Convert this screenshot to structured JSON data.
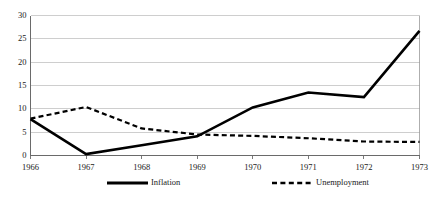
{
  "chart_data": {
    "type": "line",
    "title": "",
    "subtitle": "",
    "xlabel": "",
    "ylabel": "",
    "categories": [
      "1966",
      "1967",
      "1968",
      "1969",
      "1970",
      "1971",
      "1972",
      "1973"
    ],
    "x": [
      1966,
      1967,
      1968,
      1969,
      1970,
      1971,
      1972,
      1973
    ],
    "series": [
      {
        "name": "Inflation",
        "style": "solid",
        "color": "#000000",
        "values": [
          7.8,
          0.3,
          2.2,
          4.1,
          10.3,
          13.5,
          12.5,
          26.7
        ]
      },
      {
        "name": "Unemployment",
        "style": "dashed",
        "color": "#000000",
        "values": [
          7.9,
          10.4,
          5.8,
          4.5,
          4.2,
          3.7,
          3.0,
          2.9
        ]
      }
    ],
    "ylim": [
      0,
      30
    ],
    "xlim": [
      1966,
      1973
    ],
    "yticks": [
      0,
      5,
      10,
      15,
      20,
      25,
      30
    ],
    "ytick_labels": [
      "0",
      "5",
      "10",
      "15",
      "20",
      "25",
      "30"
    ],
    "xtick_labels": [
      "1966",
      "1967",
      "1968",
      "1969",
      "1970",
      "1971",
      "1972",
      "1973"
    ],
    "grid": true,
    "grid_axis": "y",
    "grid_color": "#b9b9b9",
    "legend_position": "bottom",
    "legend_entries": [
      "Inflation",
      "Unemployment"
    ],
    "background_color": "#ffffff"
  },
  "axes": {
    "y_ticks": [
      {
        "label": "30",
        "value": 30
      },
      {
        "label": "25",
        "value": 25
      },
      {
        "label": "20",
        "value": 20
      },
      {
        "label": "15",
        "value": 15
      },
      {
        "label": "10",
        "value": 10
      },
      {
        "label": "5",
        "value": 5
      },
      {
        "label": "0",
        "value": 0
      }
    ],
    "x_ticks": [
      {
        "label": "1966",
        "value": 1966
      },
      {
        "label": "1967",
        "value": 1967
      },
      {
        "label": "1968",
        "value": 1968
      },
      {
        "label": "1969",
        "value": 1969
      },
      {
        "label": "1970",
        "value": 1970
      },
      {
        "label": "1971",
        "value": 1971
      },
      {
        "label": "1972",
        "value": 1972
      },
      {
        "label": "1973",
        "value": 1973
      }
    ]
  },
  "legend": {
    "items": [
      {
        "label": "Inflation",
        "style": "solid"
      },
      {
        "label": "Unemployment",
        "style": "dashed"
      }
    ]
  }
}
